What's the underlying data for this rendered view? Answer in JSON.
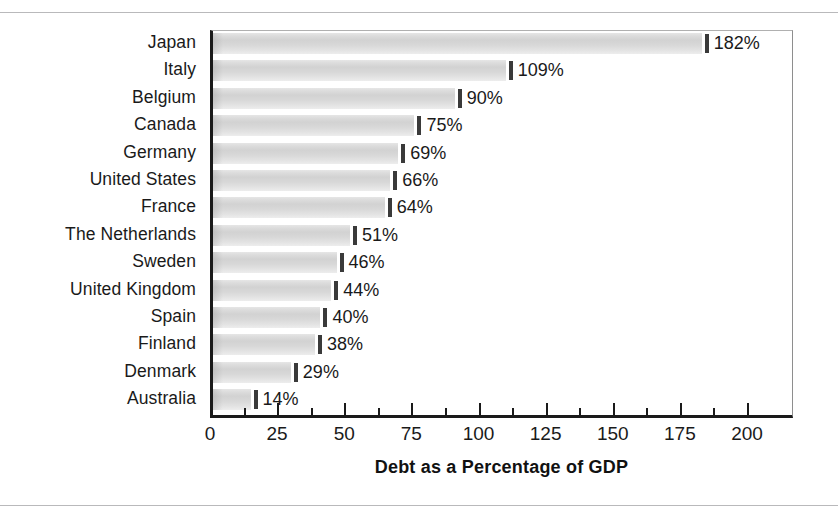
{
  "chart_data": {
    "type": "bar",
    "orientation": "horizontal",
    "title": "",
    "xlabel": "Debt as a Percentage of GDP",
    "ylabel": "",
    "xlim": [
      0,
      217
    ],
    "grid": false,
    "legend": null,
    "xticks": [
      0,
      25,
      50,
      75,
      100,
      125,
      150,
      175,
      200
    ],
    "xtick_labels": [
      "0",
      "25",
      "50",
      "75",
      "100",
      "125",
      "150",
      "175",
      "200"
    ],
    "minor_tick_step": 12.5,
    "categories": [
      "Japan",
      "Italy",
      "Belgium",
      "Canada",
      "Germany",
      "United States",
      "France",
      "The Netherlands",
      "Sweden",
      "United Kingdom",
      "Spain",
      "Finland",
      "Denmark",
      "Australia"
    ],
    "values": [
      182,
      109,
      90,
      75,
      69,
      66,
      64,
      51,
      46,
      44,
      40,
      38,
      29,
      14
    ],
    "value_labels": [
      "182%",
      "109%",
      "90%",
      "75%",
      "69%",
      "66%",
      "64%",
      "51%",
      "46%",
      "44%",
      "40%",
      "38%",
      "29%",
      "14%"
    ],
    "bar_color": "#d9d9d9",
    "bar_edge_color": "#3a3a3a",
    "axis_color": "#1a1a1a",
    "text_color": "#1a1a1a",
    "background_color": "#ffffff"
  }
}
